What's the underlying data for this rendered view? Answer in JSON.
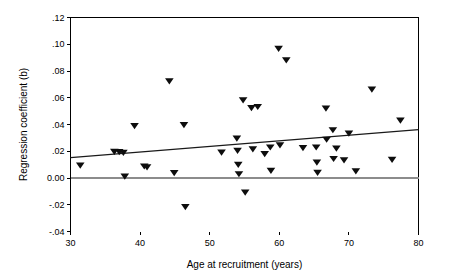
{
  "chart_data": {
    "type": "scatter",
    "title": "",
    "xlabel": "Age at recruitment (years)",
    "ylabel": "Regression coefficient (b)",
    "xlim": [
      30,
      80
    ],
    "ylim": [
      -0.04,
      0.12
    ],
    "xticks": [
      30,
      40,
      50,
      60,
      70,
      80
    ],
    "xtick_labels": [
      "30",
      "40",
      "50",
      "60",
      "70",
      "80"
    ],
    "yticks": [
      -0.04,
      -0.02,
      0.0,
      0.02,
      0.04,
      0.06,
      0.08,
      0.1,
      0.12
    ],
    "ytick_labels": [
      "-.04",
      "-.02",
      "0.00",
      ".02",
      ".04",
      ".06",
      ".08",
      ".10",
      ".12"
    ],
    "grid": false,
    "legend": null,
    "marker_shape": "triangle-down",
    "marker_color": "#0d0d0d",
    "reference_lines": [
      {
        "name": "zero-line",
        "orientation": "horizontal",
        "y": 0.0,
        "color": "#8c8c8c"
      }
    ],
    "trend_line": {
      "name": "linear-fit",
      "color": "#1a1a1a",
      "x_start": 30,
      "y_start": 0.0152,
      "x_end": 80,
      "y_end": 0.0362
    },
    "points": [
      {
        "x": 31.4,
        "y": 0.0093
      },
      {
        "x": 36.3,
        "y": 0.0196
      },
      {
        "x": 37.0,
        "y": 0.0193
      },
      {
        "x": 37.6,
        "y": 0.0188
      },
      {
        "x": 37.8,
        "y": 0.0011
      },
      {
        "x": 39.2,
        "y": 0.0388
      },
      {
        "x": 40.6,
        "y": 0.0086
      },
      {
        "x": 41.0,
        "y": 0.0079
      },
      {
        "x": 44.2,
        "y": 0.0723
      },
      {
        "x": 44.9,
        "y": 0.0037
      },
      {
        "x": 46.3,
        "y": 0.0396
      },
      {
        "x": 46.5,
        "y": -0.0218
      },
      {
        "x": 51.7,
        "y": 0.019
      },
      {
        "x": 53.9,
        "y": 0.0295
      },
      {
        "x": 54.0,
        "y": 0.0203
      },
      {
        "x": 54.1,
        "y": 0.0098
      },
      {
        "x": 54.2,
        "y": 0.0028
      },
      {
        "x": 54.8,
        "y": 0.058
      },
      {
        "x": 55.1,
        "y": -0.011
      },
      {
        "x": 56.0,
        "y": 0.0522
      },
      {
        "x": 56.2,
        "y": 0.0214
      },
      {
        "x": 56.9,
        "y": 0.0531
      },
      {
        "x": 57.9,
        "y": 0.0178
      },
      {
        "x": 58.7,
        "y": 0.0228
      },
      {
        "x": 58.8,
        "y": 0.0053
      },
      {
        "x": 59.9,
        "y": 0.0966
      },
      {
        "x": 60.1,
        "y": 0.0244
      },
      {
        "x": 61.0,
        "y": 0.088
      },
      {
        "x": 63.4,
        "y": 0.0224
      },
      {
        "x": 65.3,
        "y": 0.0228
      },
      {
        "x": 65.4,
        "y": 0.0115
      },
      {
        "x": 65.5,
        "y": 0.0039
      },
      {
        "x": 66.7,
        "y": 0.0519
      },
      {
        "x": 66.8,
        "y": 0.0286
      },
      {
        "x": 67.7,
        "y": 0.0357
      },
      {
        "x": 67.8,
        "y": 0.0142
      },
      {
        "x": 68.2,
        "y": 0.0219
      },
      {
        "x": 69.3,
        "y": 0.0132
      },
      {
        "x": 70.0,
        "y": 0.0332
      },
      {
        "x": 71.0,
        "y": 0.005
      },
      {
        "x": 73.3,
        "y": 0.0661
      },
      {
        "x": 76.2,
        "y": 0.0135
      },
      {
        "x": 77.4,
        "y": 0.0429
      }
    ]
  }
}
